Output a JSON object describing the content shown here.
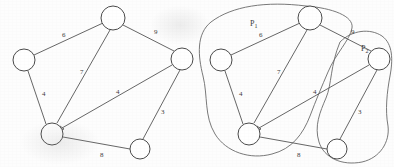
{
  "figure": {
    "background_color": "#fdfdfd",
    "ink_color": "#4a4a4a"
  },
  "graphs": [
    {
      "name": "original-graph",
      "origin_x": 0,
      "nodes": [
        {
          "id": "n1",
          "label": "",
          "cx": 24,
          "cy": 60,
          "r": 11
        },
        {
          "id": "n2",
          "label": "",
          "cx": 113,
          "cy": 18,
          "r": 12
        },
        {
          "id": "n3",
          "label": "",
          "cx": 182,
          "cy": 59,
          "r": 11
        },
        {
          "id": "n4",
          "label": "",
          "cx": 52,
          "cy": 134,
          "r": 11
        },
        {
          "id": "n5",
          "label": "",
          "cx": 140,
          "cy": 149,
          "r": 10
        }
      ],
      "edges": [
        {
          "from": "n1",
          "to": "n2",
          "weight": "6",
          "lx": 62,
          "ly": 37
        },
        {
          "from": "n2",
          "to": "n3",
          "weight": "9",
          "lx": 154,
          "ly": 34
        },
        {
          "from": "n2",
          "to": "n4",
          "weight": "7",
          "lx": 80,
          "ly": 74
        },
        {
          "from": "n1",
          "to": "n4",
          "weight": "4",
          "lx": 42,
          "ly": 96
        },
        {
          "from": "n3",
          "to": "n4",
          "weight": "4",
          "lx": 116,
          "ly": 94
        },
        {
          "from": "n3",
          "to": "n5",
          "weight": "3",
          "lx": 161,
          "ly": 114
        },
        {
          "from": "n4",
          "to": "n5",
          "weight": "8",
          "lx": 100,
          "ly": 157
        }
      ]
    },
    {
      "name": "partitioned-graph",
      "origin_x": 197,
      "nodes": [
        {
          "id": "m1",
          "label": "",
          "cx": 221,
          "cy": 60,
          "r": 11
        },
        {
          "id": "m2",
          "label": "",
          "cx": 310,
          "cy": 18,
          "r": 12
        },
        {
          "id": "m3",
          "label": "",
          "cx": 379,
          "cy": 59,
          "r": 11
        },
        {
          "id": "m4",
          "label": "",
          "cx": 249,
          "cy": 134,
          "r": 11
        },
        {
          "id": "m5",
          "label": "",
          "cx": 337,
          "cy": 149,
          "r": 10
        }
      ],
      "edges": [
        {
          "from": "m1",
          "to": "m2",
          "weight": "6",
          "lx": 259,
          "ly": 37
        },
        {
          "from": "m2",
          "to": "m3",
          "weight": "9",
          "lx": 351,
          "ly": 34
        },
        {
          "from": "m2",
          "to": "m4",
          "weight": "7",
          "lx": 277,
          "ly": 74
        },
        {
          "from": "m1",
          "to": "m4",
          "weight": "4",
          "lx": 239,
          "ly": 96
        },
        {
          "from": "m3",
          "to": "m4",
          "weight": "4",
          "lx": 313,
          "ly": 94
        },
        {
          "from": "m3",
          "to": "m5",
          "weight": "3",
          "lx": 358,
          "ly": 114
        },
        {
          "from": "m4",
          "to": "m5",
          "weight": "8",
          "lx": 297,
          "ly": 157
        }
      ],
      "partitions": [
        {
          "name": "partition-p1",
          "label_base": "P",
          "label_sub": "1",
          "lx": 250,
          "ly": 26,
          "members": [
            "m1",
            "m2",
            "m4"
          ],
          "path": "M 306 6 C 266 1 232 6 211 22 C 196 34 198 56 203 76 C 208 96 204 116 215 134 C 226 152 250 160 272 154 C 292 149 303 134 310 116 C 316 100 322 86 328 72 C 336 53 350 40 352 28 C 354 16 332 8 306 6 Z"
        },
        {
          "name": "partition-p2",
          "label_base": "P",
          "label_sub": "2",
          "lx": 361,
          "ly": 51,
          "members": [
            "m3",
            "m5"
          ],
          "path": "M 340 42 C 352 30 370 28 382 36 C 393 44 393 60 390 76 C 387 92 385 110 388 126 C 390 142 380 158 362 162 C 342 166 324 158 319 142 C 314 126 320 112 326 98 C 332 84 330 66 340 42 Z"
        }
      ]
    }
  ]
}
